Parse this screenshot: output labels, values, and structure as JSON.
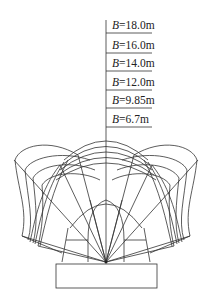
{
  "diagram": {
    "type": "tunnel-section-influence-diagram",
    "labels": [
      {
        "var": "B",
        "text": "=18.0m",
        "full": "B=18.0m"
      },
      {
        "var": "B",
        "text": "=16.0m",
        "full": "B=16.0m"
      },
      {
        "var": "B",
        "text": "=14.0m",
        "full": "B=14.0m"
      },
      {
        "var": "B",
        "text": "=12.0m",
        "full": "B=12.0m"
      },
      {
        "var": "B",
        "text": "=9.85m",
        "full": "B=9.85m"
      },
      {
        "var": "B",
        "text": "=6.7m",
        "full": "B=6.7m"
      }
    ],
    "stroke_color": "#333333",
    "background": "#ffffff"
  }
}
